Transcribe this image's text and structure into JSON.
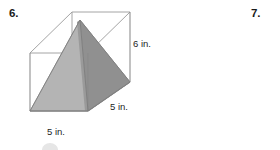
{
  "page": {
    "background_color": "#ffffff",
    "width": 280,
    "height": 150
  },
  "problems": [
    {
      "number": "6.",
      "name": "problem-6"
    },
    {
      "number": "7.",
      "name": "problem-7"
    }
  ],
  "figure": {
    "name": "prism-with-inscribed-pyramid",
    "colors": {
      "edge": "#8c8c8c",
      "pyramid_front_left_face": "#b4b4b4",
      "pyramid_right_face": "#909090",
      "pyramid_inner_face": "#a0a0a0",
      "pyramid_top_sliver": "#9a9a9a",
      "outline": "#7a7a7a"
    },
    "labels": {
      "height": "6 in.",
      "depth": "5 in.",
      "width": "5 in."
    },
    "vertices": {
      "front_top_left": [
        30,
        53
      ],
      "front_top_right": [
        88,
        53
      ],
      "front_bottom_right": [
        88,
        111
      ],
      "front_bottom_left": [
        30,
        111
      ],
      "back_top_left": [
        72,
        12
      ],
      "back_top_right": [
        130,
        12
      ],
      "back_bottom_right": [
        130,
        82
      ],
      "back_bottom_left": [
        72,
        70
      ],
      "pyramid_apex": [
        80,
        20
      ]
    }
  },
  "artifacts": {
    "top_clipped_text": "",
    "bottom_bubble": "partial-circle-glyph"
  }
}
